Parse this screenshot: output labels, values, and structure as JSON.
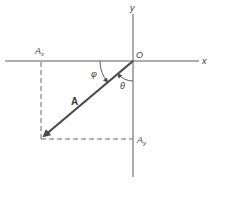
{
  "diagram": {
    "type": "vector-components",
    "colors": {
      "axis": "#5a5a5a",
      "vector": "#4a4a4a",
      "dashed": "#6a6a6a",
      "text": "#3a3a3a",
      "background": "#ffffff"
    },
    "axes": {
      "x_label": "x",
      "y_label": "y",
      "origin_label": "O"
    },
    "vector": {
      "label": "A",
      "direction": "third quadrant (down-left from origin)"
    },
    "components": {
      "x_label_main": "A",
      "x_label_sub": "x",
      "y_label_main": "A",
      "y_label_sub": "y"
    },
    "angles": {
      "phi_label": "φ",
      "phi_description": "angle between negative x-axis and vector A",
      "theta_label": "θ",
      "theta_description": "angle between negative y-axis and vector A"
    }
  }
}
